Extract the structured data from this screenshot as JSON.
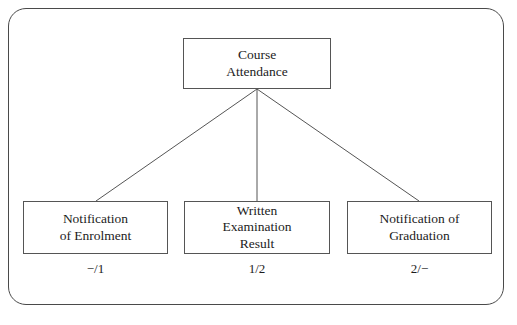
{
  "figure": {
    "background_color": "#ffffff",
    "line_color": "#555555",
    "frame_color": "#4a4a4a",
    "text_color": "#1c1c1c"
  },
  "diagram": {
    "type": "tree",
    "root": {
      "id": "course-attendance",
      "label": "Course\nAttendance"
    },
    "children": [
      {
        "id": "notification-of-enrolment",
        "label": "Notification\nof Enrolment",
        "annotation": "−/1"
      },
      {
        "id": "written-examination-result",
        "label": "Written\nExamination\nResult",
        "annotation": "1/2"
      },
      {
        "id": "notification-of-graduation",
        "label": "Notification of\nGraduation",
        "annotation": "2/−"
      }
    ]
  }
}
